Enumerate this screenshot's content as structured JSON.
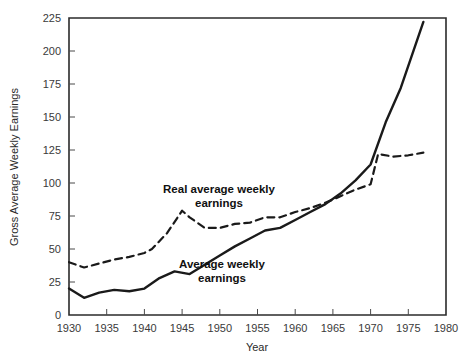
{
  "chart_data": {
    "type": "line",
    "title": "",
    "subtitle": "",
    "xlabel": "Year",
    "ylabel": "Gross Average Weekly Earnings",
    "xlim": [
      1930,
      1980
    ],
    "ylim": [
      0,
      225
    ],
    "xticks": [
      1930,
      1935,
      1940,
      1945,
      1950,
      1955,
      1960,
      1965,
      1970,
      1975,
      1980
    ],
    "yticks": [
      0,
      25,
      50,
      75,
      100,
      125,
      150,
      175,
      200,
      225
    ],
    "xtick_labels": [
      "1930",
      "1935",
      "1940",
      "1945",
      "1950",
      "1955",
      "1960",
      "1965",
      "1970",
      "1975",
      "1980"
    ],
    "ytick_labels": [
      "0",
      "25",
      "50",
      "75",
      "100",
      "125",
      "150",
      "175",
      "200",
      "225"
    ],
    "grid": false,
    "legend": "inline-annotations",
    "series": [
      {
        "name": "Real average weekly earnings",
        "style": "dashed",
        "color": "#1a1a1a",
        "x": [
          1930,
          1932,
          1934,
          1936,
          1938,
          1940,
          1941,
          1943,
          1945,
          1946,
          1948,
          1950,
          1952,
          1954,
          1956,
          1958,
          1960,
          1962,
          1964,
          1966,
          1968,
          1970,
          1971,
          1973,
          1975,
          1977
        ],
        "values": [
          40,
          36,
          39,
          42,
          44,
          47,
          50,
          62,
          79,
          74,
          66,
          66,
          69,
          70,
          74,
          74,
          78,
          81,
          85,
          90,
          95,
          99,
          122,
          120,
          121,
          123
        ]
      },
      {
        "name": "Average weekly earnings",
        "style": "solid",
        "color": "#1a1a1a",
        "x": [
          1930,
          1932,
          1934,
          1936,
          1938,
          1940,
          1942,
          1944,
          1946,
          1948,
          1950,
          1952,
          1954,
          1956,
          1958,
          1960,
          1962,
          1964,
          1966,
          1968,
          1970,
          1972,
          1974,
          1977
        ],
        "values": [
          20,
          13,
          17,
          19,
          18,
          20,
          28,
          33,
          31,
          38,
          45,
          52,
          58,
          64,
          66,
          72,
          78,
          84,
          92,
          102,
          114,
          146,
          172,
          222
        ]
      }
    ],
    "annotations": [
      {
        "id": "real-earnings-annotation",
        "line1": "Real average weekly",
        "line2": "earnings",
        "x": 219,
        "y": 193
      },
      {
        "id": "average-earnings-annotation",
        "line1": "Average weekly",
        "line2": "earnings",
        "x": 222,
        "y": 268
      }
    ]
  },
  "axes": {
    "y_axis_title": "Gross Average Weekly Earnings",
    "x_axis_title": "Year"
  },
  "colors": {
    "line": "#1a1a1a",
    "frame": "#2b2b2b",
    "text": "#2a2a2a",
    "background": "#ffffff"
  }
}
